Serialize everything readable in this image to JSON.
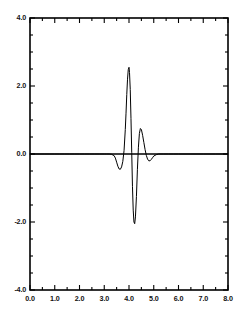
{
  "chart_data": {
    "type": "line",
    "title": "",
    "subtitle": "",
    "xlabel": "",
    "ylabel": "",
    "xlim": [
      0.0,
      8.0
    ],
    "ylim": [
      -4.0,
      4.0
    ],
    "grid": false,
    "legend": null,
    "legend_position": "none",
    "line_color": "#000000",
    "background_color": "#ffffff",
    "frame_color": "#000000",
    "x_major_ticks": [
      0.0,
      1.0,
      2.0,
      3.0,
      4.0,
      5.0,
      6.0,
      7.0,
      8.0
    ],
    "x_tick_labels": [
      "0.0",
      "1.0",
      "2.0",
      "3.0",
      "4.0",
      "5.0",
      "6.0",
      "7.0",
      "8.0"
    ],
    "x_minor_tick_interval": 0.5,
    "y_major_ticks": [
      -4.0,
      -2.0,
      0.0,
      2.0,
      4.0
    ],
    "y_tick_labels": [
      "-4.0",
      "-2.0",
      "0.0",
      "2.0",
      "4.0"
    ],
    "y_minor_tick_interval": 0.5,
    "zero_line": 0.0,
    "series": [
      {
        "name": "wavelet",
        "x": [
          0.0,
          0.2,
          0.4,
          0.6,
          0.8,
          1.0,
          1.2,
          1.4,
          1.6,
          1.8,
          2.0,
          2.2,
          2.4,
          2.6,
          2.8,
          3.0,
          3.1,
          3.2,
          3.3,
          3.4,
          3.45,
          3.5,
          3.55,
          3.6,
          3.65,
          3.7,
          3.75,
          3.8,
          3.85,
          3.88,
          3.91,
          3.94,
          3.97,
          4.0,
          4.02,
          4.05,
          4.08,
          4.11,
          4.14,
          4.17,
          4.2,
          4.23,
          4.26,
          4.3,
          4.34,
          4.38,
          4.42,
          4.46,
          4.5,
          4.55,
          4.6,
          4.65,
          4.7,
          4.75,
          4.8,
          4.85,
          4.9,
          4.95,
          5.0,
          5.1,
          5.2,
          5.4,
          5.6,
          5.8,
          6.0,
          6.5,
          7.0,
          7.5,
          8.0
        ],
        "y": [
          0.0,
          0.0,
          0.0,
          0.0,
          0.0,
          0.0,
          0.0,
          0.0,
          0.0,
          0.0,
          0.0,
          0.0,
          0.0,
          0.0,
          0.0,
          0.0,
          0.0,
          0.0,
          -0.01,
          -0.05,
          -0.12,
          -0.24,
          -0.36,
          -0.44,
          -0.45,
          -0.38,
          -0.22,
          0.1,
          0.72,
          1.2,
          1.75,
          2.2,
          2.48,
          2.55,
          2.4,
          1.9,
          1.05,
          0.05,
          -0.95,
          -1.65,
          -2.0,
          -2.05,
          -1.85,
          -1.25,
          -0.45,
          0.2,
          0.6,
          0.75,
          0.72,
          0.55,
          0.34,
          0.13,
          -0.04,
          -0.15,
          -0.2,
          -0.2,
          -0.16,
          -0.11,
          -0.06,
          -0.02,
          0.0,
          0.0,
          0.0,
          0.0,
          0.0,
          0.0,
          0.0,
          0.0,
          0.0
        ]
      }
    ],
    "annotations": []
  },
  "axes": {
    "x_labels": [
      "0.0",
      "1.0",
      "2.0",
      "3.0",
      "4.0",
      "5.0",
      "6.0",
      "7.0",
      "8.0"
    ],
    "y_labels": [
      "4.0",
      "2.0",
      "0.0",
      "-2.0",
      "-4.0"
    ]
  }
}
